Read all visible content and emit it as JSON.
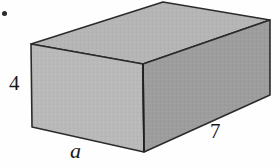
{
  "figure": {
    "kind": "rectangular-prism",
    "caption_bullet": "•",
    "background_color": "#fefefe",
    "edge_color": "#2b2b2b",
    "faces": {
      "top": {
        "name": "top-face",
        "fill": "#b5b5b5"
      },
      "front": {
        "name": "front-left-face",
        "fill": "#b9b9b9"
      },
      "side": {
        "name": "front-right-face",
        "fill": "#9d9d9d"
      }
    },
    "vertices": {
      "top_back": [
        163,
        2
      ],
      "top_right": [
        270,
        20
      ],
      "top_front": [
        143,
        64
      ],
      "top_left": [
        31,
        44
      ],
      "bottom_left": [
        32,
        127
      ],
      "bottom_front": [
        144,
        152
      ],
      "bottom_right": [
        270,
        95
      ]
    }
  },
  "labels": {
    "height": "4",
    "depth": "a",
    "width": "7"
  }
}
